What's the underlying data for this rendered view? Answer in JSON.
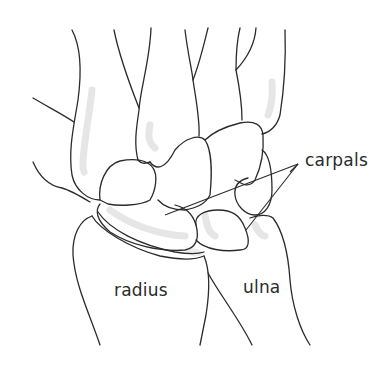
{
  "figure": {
    "labels": {
      "carpals": "carpals",
      "radius": "radius",
      "ulna": "ulna"
    },
    "colors": {
      "line": "#2b2b2b",
      "shading": "#e6e6e6",
      "background": "#ffffff",
      "text": "#2a2a2a"
    }
  }
}
